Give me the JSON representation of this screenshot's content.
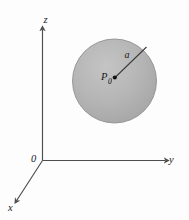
{
  "figure": {
    "background_color": "#fdfdfd",
    "axes": {
      "origin_label": "0",
      "z_label": "z",
      "y_label": "y",
      "x_label": "x",
      "line_color": "#4d4d4d"
    },
    "sphere": {
      "fill_color": "#b4b4b4",
      "stroke_color": "#8c8c8c",
      "center_label": "P",
      "center_label_subscript": "0",
      "radius_label": "a",
      "center_dot_color": "#141414"
    }
  }
}
